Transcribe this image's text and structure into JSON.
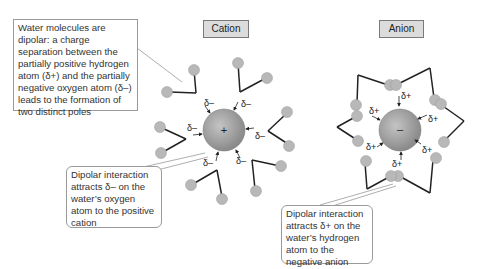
{
  "labels": {
    "cation": "Cation",
    "anion": "Anion"
  },
  "callouts": {
    "intro": "Water molecules are dipolar: a charge separation between the partially positive hydrogen atom (δ+) and the partially negative oxygen atom (δ–) leads to the formation of two distinct poles",
    "cation": "Dipolar interaction attracts δ– on the water’s oxygen atom to the positive cation",
    "anion": "Dipolar interaction attracts δ+ on the water’s hydrogen atom to the negative anion"
  },
  "ions": {
    "cation_symbol": "+",
    "anion_symbol": "–"
  },
  "partial_charges": {
    "negative": "δ–",
    "positive": "δ+"
  },
  "colors": {
    "ion_fill": "#9a9a9a",
    "atom_fill": "#b8b8b8",
    "bond": "#222222",
    "label_bg": "#dcdcdc"
  }
}
